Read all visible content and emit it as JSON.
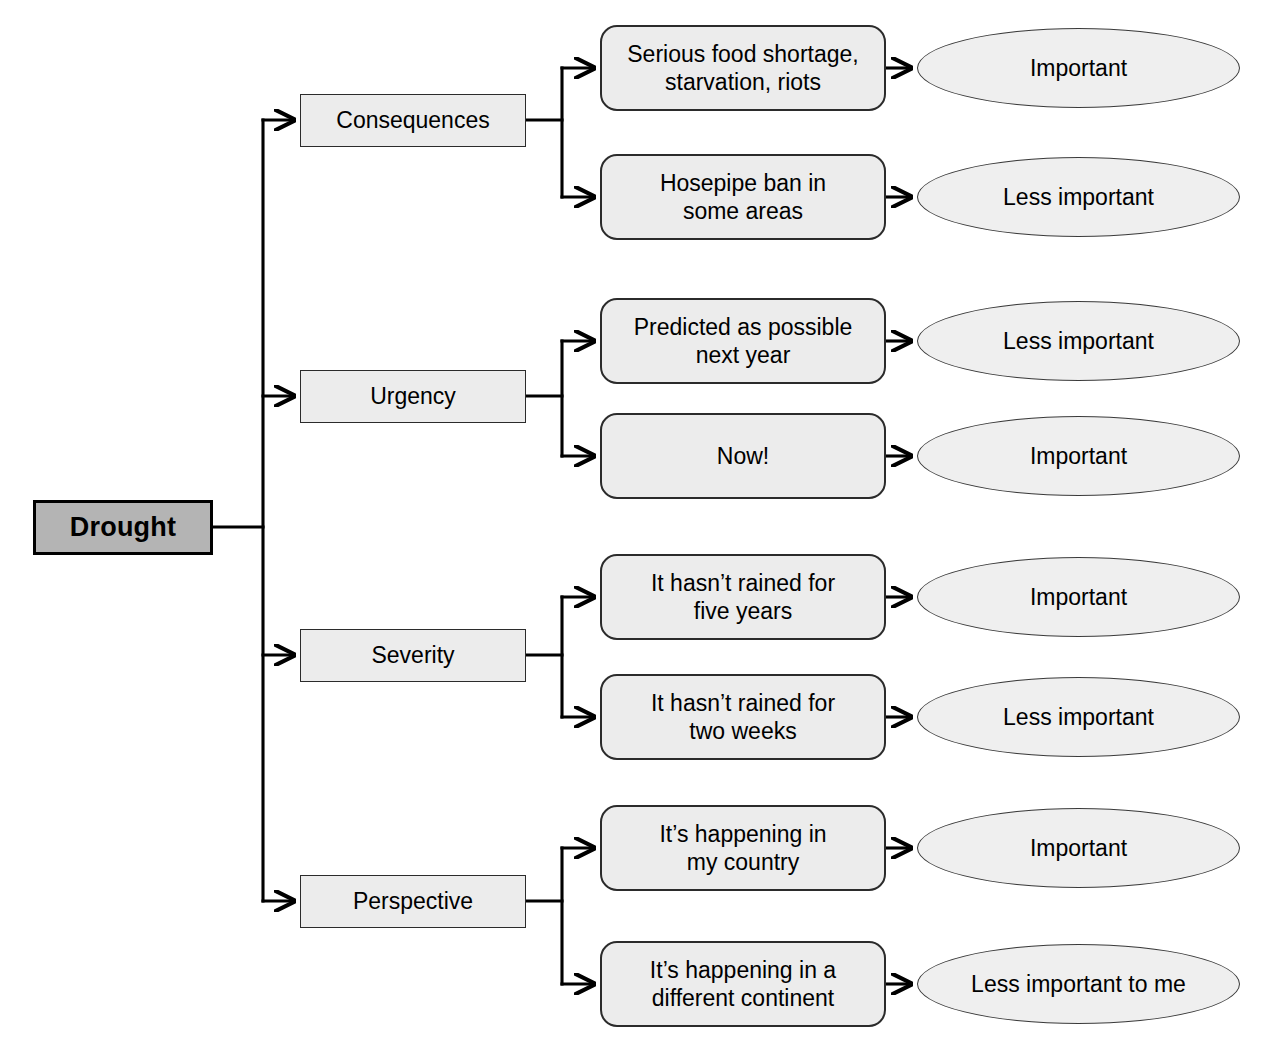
{
  "diagram": {
    "type": "tree",
    "root": {
      "label": "Drought",
      "shape": "rectangle",
      "fill": "#b4b4b4",
      "border": "#000000"
    },
    "shapes": {
      "category": "rectangle",
      "detail": "rounded-rectangle",
      "outcome": "ellipse"
    },
    "colors": {
      "root_fill": "#b4b4b4",
      "category_fill": "#ececec",
      "detail_fill": "#ececec",
      "outcome_fill": "#efefef",
      "line": "#000000",
      "text": "#000000",
      "background": "#ffffff"
    },
    "branches": [
      {
        "id": "consequences",
        "label": "Consequences",
        "children": [
          {
            "id": "consequences-severe",
            "detail": "Serious food shortage,\nstarvation, riots",
            "outcome": "Important"
          },
          {
            "id": "consequences-mild",
            "detail": "Hosepipe ban in\nsome areas",
            "outcome": "Less important"
          }
        ]
      },
      {
        "id": "urgency",
        "label": "Urgency",
        "children": [
          {
            "id": "urgency-future",
            "detail": "Predicted as possible\nnext year",
            "outcome": "Less important"
          },
          {
            "id": "urgency-present",
            "detail": "Now!",
            "outcome": "Important"
          }
        ]
      },
      {
        "id": "severity",
        "label": "Severity",
        "children": [
          {
            "id": "severity-high",
            "detail": "It hasn’t rained for\nfive years",
            "outcome": "Important"
          },
          {
            "id": "severity-low",
            "detail": "It hasn’t rained for\ntwo weeks",
            "outcome": "Less important"
          }
        ]
      },
      {
        "id": "perspective",
        "label": "Perspective",
        "children": [
          {
            "id": "perspective-local",
            "detail": "It’s happening in\nmy country",
            "outcome": "Important"
          },
          {
            "id": "perspective-distant",
            "detail": "It’s happening in a\ndifferent continent",
            "outcome": "Less important to me"
          }
        ]
      }
    ],
    "caption": ""
  }
}
